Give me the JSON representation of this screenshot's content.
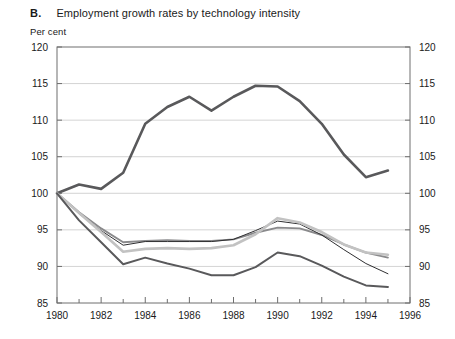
{
  "figure": {
    "panel_letter": "B.",
    "title": "Employment growth rates by technology intensity",
    "unit_label": "Per cent"
  },
  "chart_data": {
    "type": "line",
    "title": "Employment growth rates by technology intensity",
    "xlabel": "",
    "ylabel": "Per cent",
    "xlim": [
      1980,
      1996
    ],
    "ylim": [
      85,
      120
    ],
    "y_ticks": [
      85,
      90,
      95,
      100,
      105,
      110,
      115,
      120
    ],
    "x_ticks": [
      1980,
      1982,
      1984,
      1986,
      1988,
      1990,
      1992,
      1994,
      1996
    ],
    "x_minor_tick_step": 1,
    "grid": "horizontal",
    "legend": "none",
    "dual_y_axis": true,
    "x": [
      1980,
      1981,
      1982,
      1983,
      1984,
      1985,
      1986,
      1987,
      1988,
      1989,
      1990,
      1991,
      1992,
      1993,
      1994,
      1995
    ],
    "series": [
      {
        "name": "high-technology",
        "color": "#59595b",
        "width": 2.6,
        "values": [
          100.0,
          101.2,
          100.6,
          102.8,
          109.5,
          111.8,
          113.2,
          111.3,
          113.2,
          114.7,
          114.6,
          112.6,
          109.5,
          105.3,
          102.2,
          103.1
        ]
      },
      {
        "name": "medium-high-technology",
        "color": "#8a8a8c",
        "width": 1.9,
        "values": [
          100.0,
          97.4,
          95.2,
          93.3,
          93.5,
          93.6,
          93.5,
          93.5,
          93.7,
          94.6,
          95.3,
          95.2,
          94.3,
          93.0,
          91.9,
          91.2
        ]
      },
      {
        "name": "medium-low-technology",
        "color": "#2f2f31",
        "width": 1.0,
        "values": [
          100.0,
          97.2,
          94.9,
          92.9,
          93.4,
          93.4,
          93.4,
          93.4,
          93.7,
          94.9,
          96.2,
          95.8,
          94.3,
          92.3,
          90.4,
          89.0
        ]
      },
      {
        "name": "low-technology",
        "color": "#c2c2c2",
        "width": 2.6,
        "values": [
          100.0,
          97.3,
          94.7,
          92.0,
          92.4,
          92.5,
          92.4,
          92.5,
          92.9,
          94.4,
          96.6,
          96.0,
          94.7,
          93.0,
          91.9,
          91.6
        ]
      },
      {
        "name": "total-manufacturing",
        "color": "#59595b",
        "width": 2.0,
        "values": [
          100.0,
          96.3,
          93.3,
          90.3,
          91.2,
          90.4,
          89.7,
          88.8,
          88.8,
          89.9,
          91.9,
          91.4,
          90.1,
          88.6,
          87.4,
          87.2
        ]
      }
    ]
  }
}
